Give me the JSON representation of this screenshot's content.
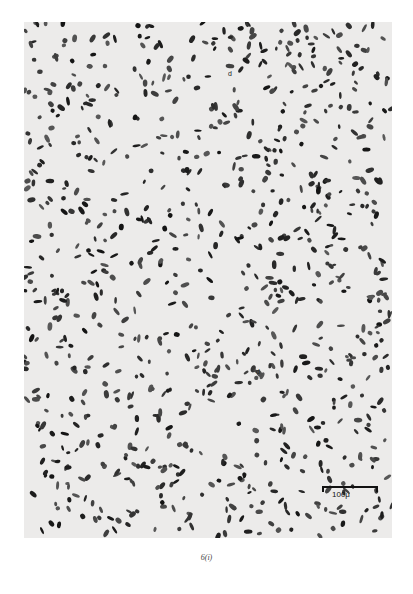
{
  "figure": {
    "caption": "6(i)",
    "scale_bar_label": "100μ",
    "annotations": [
      {
        "label": "d",
        "x": 204,
        "y": 78
      },
      {
        "label": "d",
        "x": 232,
        "y": 352
      }
    ],
    "colors": {
      "background": "#ecebea",
      "cells": "#2a2a2a"
    }
  }
}
